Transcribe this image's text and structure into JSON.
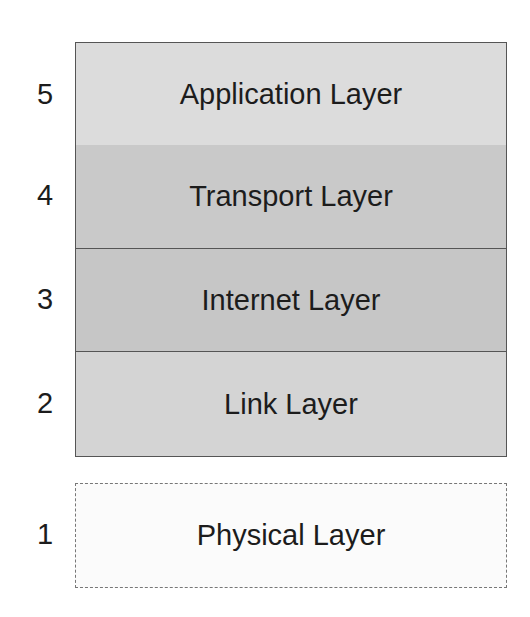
{
  "diagram": {
    "layers": [
      {
        "number": "5",
        "label": "Application Layer",
        "color": "#dcdcdc"
      },
      {
        "number": "4",
        "label": "Transport Layer",
        "color": "#c9c9c9"
      },
      {
        "number": "3",
        "label": "Internet Layer",
        "color": "#c6c6c6"
      },
      {
        "number": "2",
        "label": "Link Layer",
        "color": "#d4d4d4"
      },
      {
        "number": "1",
        "label": "Physical Layer",
        "color": "#fbfbfb"
      }
    ]
  }
}
